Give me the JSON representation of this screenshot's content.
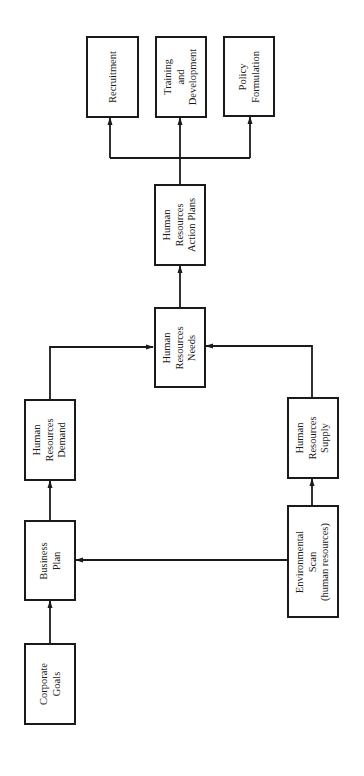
{
  "diagram": {
    "title": "",
    "orientation": "rotated-90-ccw",
    "line_color": "#1a1a1a",
    "nodes": [
      {
        "id": "corporate_goals",
        "lines": [
          "Corporate",
          "Goals"
        ]
      },
      {
        "id": "business_plan",
        "lines": [
          "Business",
          "Plan"
        ]
      },
      {
        "id": "hr_demand",
        "lines": [
          "Human",
          "Resources",
          "Demand"
        ]
      },
      {
        "id": "environmental_scan",
        "lines": [
          "Environmental",
          "Scan",
          "(human resources)"
        ]
      },
      {
        "id": "hr_supply",
        "lines": [
          "Human",
          "Resources",
          "Supply"
        ]
      },
      {
        "id": "hr_needs",
        "lines": [
          "Human",
          "Resources",
          "Needs"
        ]
      },
      {
        "id": "hr_action_plans",
        "lines": [
          "Human",
          "Resources",
          "Action Plans"
        ]
      },
      {
        "id": "recruitment",
        "lines": [
          "Recruitment"
        ]
      },
      {
        "id": "training_development",
        "lines": [
          "Training",
          "and",
          "Development"
        ]
      },
      {
        "id": "policy_formulation",
        "lines": [
          "Policy",
          "Formulation"
        ]
      }
    ],
    "edges": [
      {
        "from": "corporate_goals",
        "to": "business_plan"
      },
      {
        "from": "environmental_scan",
        "to": "business_plan"
      },
      {
        "from": "business_plan",
        "to": "hr_demand"
      },
      {
        "from": "environmental_scan",
        "to": "hr_supply"
      },
      {
        "from": "hr_demand",
        "to": "hr_needs"
      },
      {
        "from": "hr_supply",
        "to": "hr_needs"
      },
      {
        "from": "hr_needs",
        "to": "hr_action_plans"
      },
      {
        "from": "hr_action_plans",
        "to": "recruitment"
      },
      {
        "from": "hr_action_plans",
        "to": "training_development"
      },
      {
        "from": "hr_action_plans",
        "to": "policy_formulation"
      }
    ]
  }
}
